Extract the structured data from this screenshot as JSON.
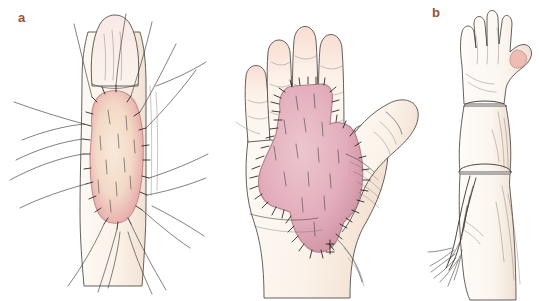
{
  "figure": {
    "background_color": "#ffffff",
    "label_color": "#9c4f33",
    "ink_color": "#3a3632",
    "panel_count": 3
  },
  "panels": [
    {
      "id": "a",
      "label": "a",
      "caption": "Full-thickness skin graft sutured to the volar aspect of a finger with long tie-over suture tails",
      "subject": "finger",
      "view": "volar",
      "graft": {
        "shape": "oval",
        "name": "finger-skin-graft",
        "fill_center": "#f6e3cf",
        "fill_edge": "#e8a9a8",
        "border_color": "#c98b8f",
        "suture_count": 26,
        "interior_dash_count": 10
      },
      "suture_tails": 12,
      "skin_fill": "#fdf7f1",
      "nail_tip_fill": "#f7e6e2"
    },
    {
      "id": "b",
      "label": "b",
      "caption": "Irregular graft inset over the palm and base of the index finger, secured with interrupted sutures",
      "subject": "hand",
      "view": "palmar",
      "digits": [
        "little",
        "ring",
        "middle",
        "index",
        "thumb"
      ],
      "graft": {
        "shape": "irregular-shield",
        "name": "palm-skin-graft",
        "fill_center": "#e7b8c4",
        "fill_edge": "#d79eae",
        "border_color": "#b07f8d",
        "suture_count": 74,
        "interior_dash_count": 14
      },
      "skin_fill": "#fdf8f3",
      "fingertip_fill": "#f7ddd3"
    },
    {
      "id": "c",
      "label": "c",
      "caption": "Postoperative elevation of the limb with a suspension dressing at the elbow",
      "subject": "arm",
      "view": "anterior-elevated",
      "dressing": {
        "name": "suspension-dressing",
        "location": "forearm-elbow",
        "frayed_ends": 7
      },
      "skin_fill": "#fdfaf6",
      "thumb_tip_fill": "#eebcb2"
    }
  ]
}
